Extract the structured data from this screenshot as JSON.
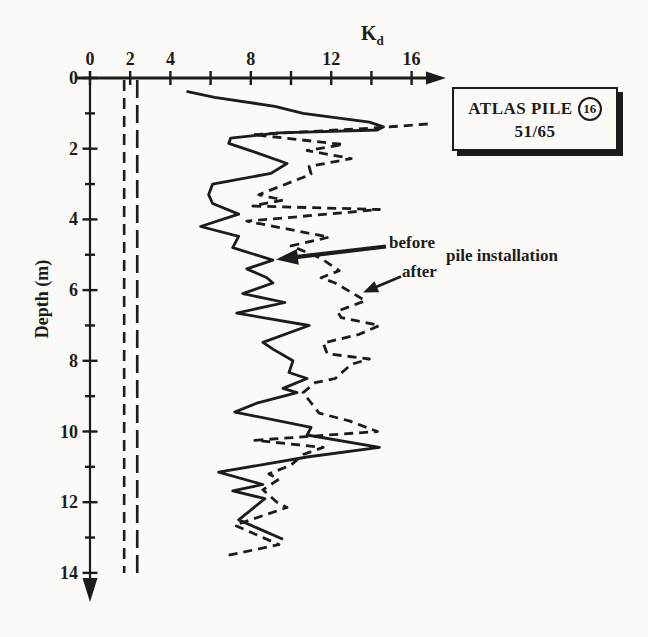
{
  "axis": {
    "x_label_main": "K",
    "x_label_sub": "d",
    "y_label": "Depth (m)"
  },
  "annotations": {
    "before": "before",
    "after": "after",
    "group": "pile installation"
  },
  "title_box": {
    "line1": "ATLAS PILE",
    "number": "16",
    "line2": "51/65"
  },
  "colors": {
    "ink": "#1c1c1c",
    "paper": "#fbfaf7"
  },
  "chart_data": {
    "type": "line",
    "xlabel": "Kd",
    "ylabel": "Depth (m)",
    "xlim": [
      0,
      16
    ],
    "ylim": [
      0,
      14
    ],
    "y_inverted": true,
    "grid": false,
    "legend_position": "annotated-arrows",
    "x_ticks": [
      {
        "v": 0,
        "label": "0"
      },
      {
        "v": 2,
        "label": "2"
      },
      {
        "v": 4,
        "label": "4"
      },
      {
        "v": 6,
        "label": ""
      },
      {
        "v": 8,
        "label": "8"
      },
      {
        "v": 10,
        "label": ""
      },
      {
        "v": 12,
        "label": "12"
      },
      {
        "v": 14,
        "label": ""
      },
      {
        "v": 16,
        "label": "16"
      }
    ],
    "y_ticks": [
      {
        "v": 0,
        "label": "0"
      },
      {
        "v": 1,
        "label": ""
      },
      {
        "v": 2,
        "label": "2"
      },
      {
        "v": 3,
        "label": ""
      },
      {
        "v": 4,
        "label": "4"
      },
      {
        "v": 5,
        "label": ""
      },
      {
        "v": 6,
        "label": "6"
      },
      {
        "v": 7,
        "label": ""
      },
      {
        "v": 8,
        "label": "8"
      },
      {
        "v": 9,
        "label": ""
      },
      {
        "v": 10,
        "label": "10"
      },
      {
        "v": 11,
        "label": ""
      },
      {
        "v": 12,
        "label": "12"
      },
      {
        "v": 13,
        "label": ""
      },
      {
        "v": 14,
        "label": "14"
      }
    ],
    "reference_lines": [
      {
        "kd": 1.7,
        "style": "dashed",
        "dash": [
          11,
          7
        ]
      },
      {
        "kd": 2.35,
        "style": "dashed",
        "dash": [
          18,
          7
        ]
      }
    ],
    "series": [
      {
        "name": "before pile installation",
        "style": "solid",
        "points_kd_depth": [
          [
            4.8,
            0.38
          ],
          [
            6.2,
            0.55
          ],
          [
            9.2,
            0.8
          ],
          [
            10.6,
            1.0
          ],
          [
            13.9,
            1.25
          ],
          [
            14.6,
            1.38
          ],
          [
            14.3,
            1.47
          ],
          [
            9.4,
            1.55
          ],
          [
            7.0,
            1.7
          ],
          [
            6.9,
            1.85
          ],
          [
            8.2,
            2.1
          ],
          [
            9.8,
            2.42
          ],
          [
            9.0,
            2.7
          ],
          [
            6.1,
            3.0
          ],
          [
            5.9,
            3.3
          ],
          [
            6.1,
            3.55
          ],
          [
            7.4,
            3.85
          ],
          [
            5.5,
            4.2
          ],
          [
            7.4,
            4.48
          ],
          [
            7.1,
            4.8
          ],
          [
            9.1,
            5.15
          ],
          [
            7.8,
            5.4
          ],
          [
            8.8,
            5.65
          ],
          [
            9.1,
            5.8
          ],
          [
            7.6,
            6.1
          ],
          [
            9.7,
            6.35
          ],
          [
            7.3,
            6.65
          ],
          [
            10.9,
            7.0
          ],
          [
            8.6,
            7.48
          ],
          [
            9.1,
            7.67
          ],
          [
            10.1,
            8.0
          ],
          [
            9.9,
            8.33
          ],
          [
            10.8,
            8.5
          ],
          [
            9.6,
            8.78
          ],
          [
            10.3,
            8.9
          ],
          [
            8.3,
            9.2
          ],
          [
            7.2,
            9.45
          ],
          [
            11.0,
            9.88
          ],
          [
            10.8,
            10.1
          ],
          [
            14.4,
            10.45
          ],
          [
            10.8,
            10.72
          ],
          [
            6.4,
            11.15
          ],
          [
            8.6,
            11.5
          ],
          [
            7.1,
            11.68
          ],
          [
            8.7,
            11.9
          ],
          [
            7.4,
            12.5
          ],
          [
            9.6,
            13.05
          ]
        ]
      },
      {
        "name": "after pile installation",
        "style": "dashed",
        "points_kd_depth": [
          [
            16.8,
            1.3
          ],
          [
            14.0,
            1.42
          ],
          [
            8.1,
            1.6
          ],
          [
            12.6,
            1.88
          ],
          [
            10.8,
            2.05
          ],
          [
            13.0,
            2.28
          ],
          [
            10.9,
            2.5
          ],
          [
            11.0,
            2.72
          ],
          [
            8.4,
            3.3
          ],
          [
            9.6,
            3.45
          ],
          [
            8.1,
            3.62
          ],
          [
            14.4,
            3.72
          ],
          [
            7.8,
            4.05
          ],
          [
            11.9,
            4.5
          ],
          [
            10.0,
            4.75
          ],
          [
            11.5,
            5.1
          ],
          [
            12.4,
            5.45
          ],
          [
            11.5,
            5.65
          ],
          [
            12.2,
            5.8
          ],
          [
            13.7,
            6.3
          ],
          [
            12.3,
            6.6
          ],
          [
            12.5,
            6.78
          ],
          [
            14.4,
            7.0
          ],
          [
            13.4,
            7.25
          ],
          [
            11.6,
            7.5
          ],
          [
            11.8,
            7.8
          ],
          [
            13.9,
            7.95
          ],
          [
            13.0,
            8.1
          ],
          [
            12.2,
            8.5
          ],
          [
            11.2,
            8.62
          ],
          [
            10.6,
            8.9
          ],
          [
            11.4,
            9.48
          ],
          [
            12.9,
            9.7
          ],
          [
            14.3,
            10.0
          ],
          [
            8.2,
            10.25
          ],
          [
            11.6,
            10.45
          ],
          [
            10.6,
            10.65
          ],
          [
            10.0,
            10.95
          ],
          [
            8.9,
            11.2
          ],
          [
            9.4,
            11.35
          ],
          [
            8.6,
            11.65
          ],
          [
            9.3,
            12.0
          ],
          [
            9.8,
            12.15
          ],
          [
            7.2,
            12.65
          ],
          [
            9.4,
            13.2
          ],
          [
            6.9,
            13.5
          ]
        ]
      }
    ]
  }
}
